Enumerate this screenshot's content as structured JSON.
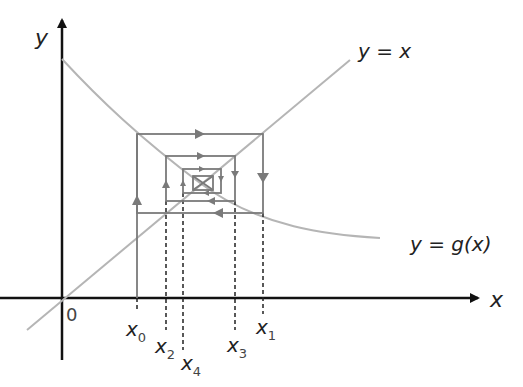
{
  "diagram": {
    "axes": {
      "x_label": "x",
      "y_label": "y",
      "origin_label": "0"
    },
    "curves": [
      {
        "name": "identity-line",
        "label": "y = x"
      },
      {
        "name": "g-curve",
        "label": "y = g(x)"
      }
    ],
    "iterates": [
      {
        "base": "x",
        "sub": "0"
      },
      {
        "base": "x",
        "sub": "1"
      },
      {
        "base": "x",
        "sub": "2"
      },
      {
        "base": "x",
        "sub": "3"
      },
      {
        "base": "x",
        "sub": "4"
      }
    ],
    "colors": {
      "axis": "#111111",
      "curve": "#b5b5b5",
      "cobweb": "#7a7a7a",
      "dashed": "#222222",
      "text": "#222222"
    }
  }
}
